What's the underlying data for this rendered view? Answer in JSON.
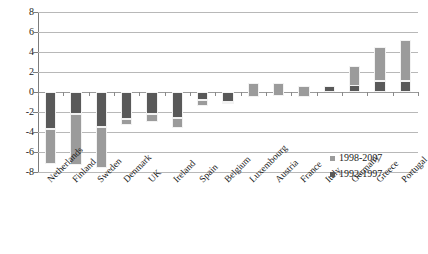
{
  "chart_data": {
    "type": "bar",
    "stacked": true,
    "title": "",
    "xlabel": "",
    "ylabel": "",
    "ylim": [
      -8,
      8
    ],
    "ytick_values": [
      8,
      6,
      4,
      2,
      0,
      -2,
      -4,
      -6,
      -8
    ],
    "ytick_labels": [
      "8",
      "6",
      "4",
      "2",
      "0",
      "-2",
      "-4",
      "-6",
      "-8"
    ],
    "grid": true,
    "legend_position": "bottom-right",
    "categories": [
      "Netherlands",
      "Finland",
      "Sweden",
      "Denmark",
      "UK",
      "Ireland",
      "Spain",
      "Belgium",
      "Luxembourg",
      "Austria",
      "France",
      "Italy",
      "Germany",
      "Greece",
      "Portugal"
    ],
    "series": [
      {
        "name": "1992-1997",
        "color": "#595959",
        "values": [
          -3.7,
          -2.2,
          -3.5,
          -2.7,
          -2.2,
          -2.6,
          -0.8,
          -1.0,
          0.9,
          0.9,
          0.6,
          0.6,
          2.6,
          1.1,
          1.1
        ]
      },
      {
        "name": "1998-2007",
        "color": "#9b9b9b",
        "values": [
          -3.5,
          -5.1,
          -4.1,
          -0.6,
          -0.8,
          -1.0,
          -0.6,
          -0.2,
          -1.4,
          -1.3,
          -1.1,
          0.0,
          -2.0,
          3.4,
          4.1
        ]
      }
    ],
    "series_totals": [
      -7.2,
      -7.3,
      -7.6,
      -3.3,
      -3.0,
      -3.6,
      -1.4,
      -1.2,
      -0.5,
      -0.4,
      -0.5,
      0.6,
      0.6,
      4.5,
      5.2
    ]
  },
  "legend": {
    "entries": [
      {
        "label": "1998-2007",
        "swatch": "light"
      },
      {
        "label": "1992-1997",
        "swatch": "dark"
      }
    ]
  }
}
